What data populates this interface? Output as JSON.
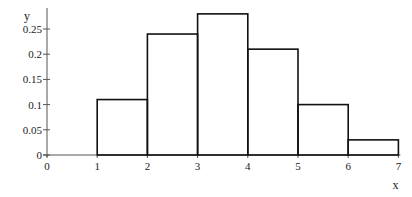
{
  "chart_data": {
    "type": "bar",
    "title": "",
    "xlabel": "x",
    "ylabel": "y",
    "bins": [
      [
        1,
        2
      ],
      [
        2,
        3
      ],
      [
        3,
        4
      ],
      [
        4,
        5
      ],
      [
        5,
        6
      ],
      [
        6,
        7
      ]
    ],
    "categories": [
      "1-2",
      "2-3",
      "3-4",
      "4-5",
      "5-6",
      "6-7"
    ],
    "values": [
      0.11,
      0.24,
      0.28,
      0.21,
      0.1,
      0.03
    ],
    "xlim": [
      0,
      7
    ],
    "ylim": [
      0,
      0.28
    ],
    "xticks": [
      "0",
      "1",
      "2",
      "3",
      "4",
      "5",
      "6",
      "7"
    ],
    "yticks": [
      "0",
      "0.05",
      "0.1",
      "0.15",
      "0.2",
      "0.25"
    ],
    "grid": false,
    "legend": null,
    "style": "histogram outline, unfilled"
  },
  "labels": {
    "x_axis": "x",
    "y_axis": "y"
  }
}
